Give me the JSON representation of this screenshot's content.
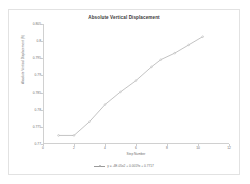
{
  "chart_data": {
    "type": "line",
    "title": "Absolute Vertical Displacement",
    "xlabel": "Step Number",
    "ylabel": "Absolute Vertical Displacement (ft)",
    "xlim": [
      0,
      12
    ],
    "ylim": [
      0.77,
      0.805
    ],
    "grid": false,
    "legend_position": "bottom",
    "xticks": [
      0,
      2,
      4,
      6,
      8,
      10,
      12
    ],
    "yticks": [
      0.77,
      0.775,
      0.78,
      0.785,
      0.79,
      0.795,
      0.8,
      0.805
    ],
    "ytick_labels": [
      "0.77",
      "0.775",
      "0.78",
      "0.785",
      "0.79",
      "0.795",
      "0.8",
      "0.805"
    ],
    "xtick_labels": [
      "0",
      "2",
      "4",
      "6",
      "8",
      "10",
      "12"
    ],
    "series": [
      {
        "name": "y = -4E-05x2 + 0.0019x + 0.7717",
        "color": "#9a9a9a",
        "marker": "circle",
        "x": [
          1,
          2,
          3,
          4,
          5,
          6,
          7,
          7.6,
          8.5,
          9.4,
          10.3
        ],
        "values": [
          0.7725,
          0.7725,
          0.7765,
          0.7815,
          0.7852,
          0.7885,
          0.7925,
          0.7946,
          0.7965,
          0.7989,
          0.8013
        ]
      }
    ]
  },
  "legend": {
    "label": "y = -4E-05x2 + 0.0019x + 0.7717",
    "swatch_name": "series-line-swatch"
  },
  "colors": {
    "series": "#9a9a9a",
    "axis": "#d0d0d0",
    "title_text": "#3a3a3a",
    "tick_text": "#707070",
    "frame_border": "#e2e2e2",
    "background": "#ffffff"
  }
}
